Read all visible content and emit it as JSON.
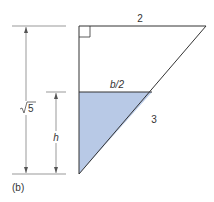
{
  "figure": {
    "panel_label": "(b)",
    "labels": {
      "top": "2",
      "hypotenuse": "3",
      "half_base": "b/2",
      "height": "h",
      "total_height_sqrt": "5"
    },
    "colors": {
      "fill": "#b8c9e6",
      "line": "#333333"
    }
  }
}
